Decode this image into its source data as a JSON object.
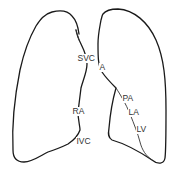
{
  "diagram": {
    "type": "chest-outline",
    "labels": {
      "svc": "SVC",
      "ra": "RA",
      "ivc": "IVC",
      "aorta": "A",
      "pa": "PA",
      "la": "LA",
      "lv": "LV"
    },
    "colors": {
      "outline": "#1a1a1a",
      "text": "#333333",
      "background": "#ffffff"
    }
  }
}
